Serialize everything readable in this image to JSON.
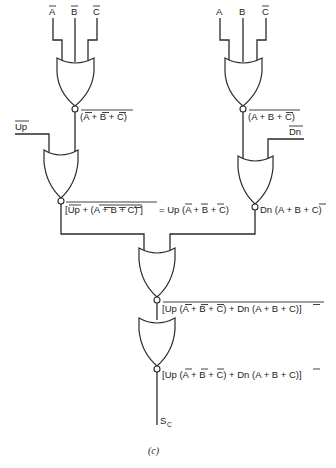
{
  "figure": {
    "caption": "(c)",
    "inputs_left": [
      "A",
      "B",
      "C"
    ],
    "inputs_left_negated": [
      true,
      true,
      true
    ],
    "inputs_right": [
      "A",
      "B",
      "C"
    ],
    "inputs_right_negated": [
      false,
      false,
      true
    ],
    "gate1_out_left": "(A + B + C)",
    "gate1_out_right": "(A + B + C)",
    "up_input": "Up",
    "dn_input": "Dn",
    "gate2_out_left": "[Up + (A + B + C) ] = Up (A + B + C)",
    "gate2_out_left_part1": "[Up + (A + B + C) ]",
    "gate2_out_left_eq": "= Up (A + B + C)",
    "gate2_out_right": "Dn (A + B + C)",
    "gate3_out": "[Up (A + B + C) + Dn (A + B + C)]",
    "gate4_out": "[Up (A + B + C) + Dn (A + B + C)]",
    "output_label": "S",
    "output_subscript": "C",
    "gate_type": "NOR",
    "colors": {
      "line": "#2a2a2a",
      "text": "#222222",
      "background": "#ffffff"
    }
  }
}
